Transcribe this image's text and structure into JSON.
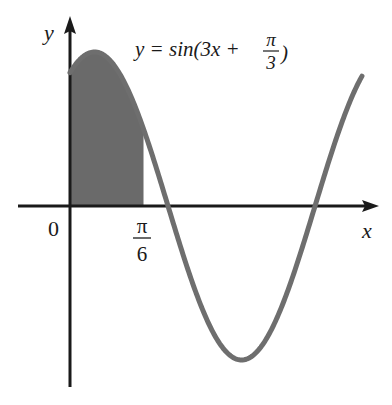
{
  "chart_data": {
    "type": "line",
    "title": "",
    "function_label": {
      "prefix": "y = sin(3x + ",
      "frac_num": "π",
      "frac_den": "3",
      "suffix": ")"
    },
    "function": "y = sin(3x + π/3)",
    "xlabel": "x",
    "ylabel": "y",
    "origin_label": "0",
    "x_tick": {
      "num": "π",
      "den": "6",
      "value": 0.5236
    },
    "shaded_region": {
      "from": 0,
      "to": 0.5236,
      "description": "area under curve from x=0 to x=π/6"
    },
    "series": [
      {
        "name": "y = sin(3x + π/3)",
        "x": [
          0,
          0.1745,
          0.3491,
          0.5236,
          0.6981,
          0.8727,
          1.0472,
          1.2217,
          1.3963,
          1.5708,
          1.7453,
          2.0
        ],
        "values": [
          0.866,
          0.985,
          0.643,
          0.0,
          -0.643,
          -0.985,
          -0.866,
          -0.342,
          0.342,
          0.866,
          0.985,
          0.866
        ]
      }
    ],
    "xlim": [
      -0.37,
      2.2
    ],
    "ylim": [
      -1.2,
      1.2
    ],
    "grid": false,
    "legend": "none"
  },
  "colors": {
    "curve": "#6e6e6e",
    "fill": "#6a6a6a",
    "axis": "#1a1a1a",
    "background": "#ffffff"
  }
}
